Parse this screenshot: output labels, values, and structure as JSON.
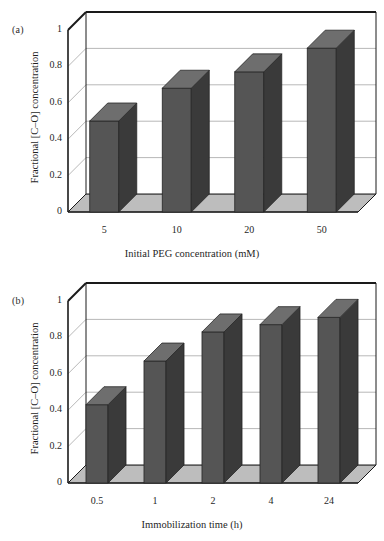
{
  "figure": {
    "background": "#ffffff",
    "bar_face_color": "#555555",
    "bar_side_color": "#3a3a3a",
    "bar_top_color": "#6e6e6e",
    "floor_color": "#bdbdbd",
    "gridline_color": "#9a9a9a",
    "axis_color": "#1a1a1a"
  },
  "panels": [
    {
      "label": "(a)",
      "chart_data": {
        "type": "bar",
        "title": "",
        "xlabel": "Initial PEG concentration (mM)",
        "ylabel": "Fractional [C–O] concentration",
        "categories": [
          "5",
          "10",
          "20",
          "50"
        ],
        "values": [
          0.5,
          0.68,
          0.77,
          0.9
        ],
        "ylim": [
          0,
          1
        ],
        "yticks": [
          "0",
          "0.2",
          "0.4",
          "0.6",
          "0.8",
          "1"
        ],
        "ytick_values": [
          0,
          0.2,
          0.4,
          0.6,
          0.8,
          1
        ],
        "grid": true,
        "legend": "none",
        "projection": "3d"
      }
    },
    {
      "label": "(b)",
      "chart_data": {
        "type": "bar",
        "title": "",
        "xlabel": "Immobilization time (h)",
        "ylabel": "Fractional [C–O] concentration",
        "categories": [
          "0.5",
          "1",
          "2",
          "4",
          "24"
        ],
        "values": [
          0.43,
          0.67,
          0.83,
          0.87,
          0.91
        ],
        "ylim": [
          0,
          1
        ],
        "yticks": [
          "0",
          "0.2",
          "0.4",
          "0.6",
          "0.8",
          "1"
        ],
        "ytick_values": [
          0,
          0.2,
          0.4,
          0.6,
          0.8,
          1
        ],
        "grid": true,
        "legend": "none",
        "projection": "3d"
      }
    }
  ]
}
